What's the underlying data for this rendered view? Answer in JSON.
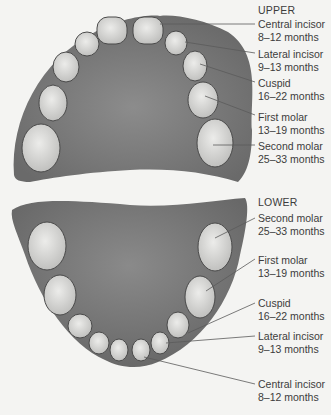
{
  "upper": {
    "heading": "UPPER",
    "labels": [
      {
        "name": "Central incisor",
        "range": "8–12 months"
      },
      {
        "name": "Lateral incisor",
        "range": "9–13 months"
      },
      {
        "name": "Cuspid",
        "range": "16–22 months"
      },
      {
        "name": "First molar",
        "range": "13–19 months"
      },
      {
        "name": "Second molar",
        "range": "25–33 months"
      }
    ]
  },
  "lower": {
    "heading": "LOWER",
    "labels": [
      {
        "name": "Second molar",
        "range": "25–33 months"
      },
      {
        "name": "First molar",
        "range": "13–19 months"
      },
      {
        "name": "Cuspid",
        "range": "16–22 months"
      },
      {
        "name": "Lateral incisor",
        "range": "9–13 months"
      },
      {
        "name": "Central incisor",
        "range": "8–12 months"
      }
    ]
  },
  "colors": {
    "gum": "#7a7a7a",
    "tooth": "#d6d6d4",
    "outline": "#4a4a4a",
    "leader": "#5a5a5a"
  }
}
